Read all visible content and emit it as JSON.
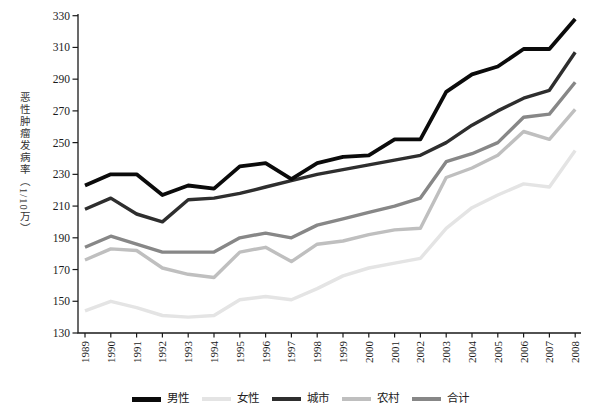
{
  "chart_data": {
    "type": "line",
    "title": "",
    "xlabel": "",
    "ylabel": "恶性肿瘤发病率（1/10万）",
    "x": [
      1989,
      1990,
      1991,
      1992,
      1993,
      1994,
      1995,
      1996,
      1997,
      1998,
      1999,
      2000,
      2001,
      2002,
      2003,
      2004,
      2005,
      2006,
      2007,
      2008
    ],
    "ylim": [
      130,
      330
    ],
    "ytick_step": 20,
    "yticks": [
      130,
      150,
      170,
      190,
      210,
      230,
      250,
      270,
      290,
      310,
      330
    ],
    "grid": false,
    "legend_position": "bottom",
    "axis_color": "#1a1a1a",
    "series": [
      {
        "id": "male",
        "name": "男性",
        "color": "#0b0b0b",
        "stroke_width": 3.8,
        "values": [
          223,
          230,
          230,
          217,
          223,
          221,
          235,
          237,
          227,
          237,
          241,
          242,
          252,
          252,
          282,
          293,
          298,
          309,
          309,
          328
        ]
      },
      {
        "id": "female",
        "name": "女性",
        "color": "#e4e4e4",
        "stroke_width": 3.4,
        "values": [
          144,
          150,
          146,
          141,
          140,
          141,
          151,
          153,
          151,
          158,
          166,
          171,
          174,
          177,
          196,
          209,
          217,
          224,
          222,
          245
        ]
      },
      {
        "id": "urban",
        "name": "城市",
        "color": "#2e2e2e",
        "stroke_width": 3.4,
        "values": [
          208,
          215,
          205,
          200,
          214,
          215,
          218,
          222,
          226,
          230,
          233,
          236,
          239,
          242,
          250,
          261,
          270,
          278,
          283,
          307
        ]
      },
      {
        "id": "rural",
        "name": "农村",
        "color": "#bfbfbf",
        "stroke_width": 3.4,
        "values": [
          176,
          183,
          182,
          171,
          167,
          165,
          181,
          184,
          175,
          186,
          188,
          192,
          195,
          196,
          228,
          234,
          242,
          257,
          252,
          271
        ]
      },
      {
        "id": "total",
        "name": "合计",
        "color": "#878787",
        "stroke_width": 3.4,
        "values": [
          184,
          191,
          186,
          181,
          181,
          181,
          190,
          193,
          190,
          198,
          202,
          206,
          210,
          215,
          238,
          243,
          250,
          266,
          268,
          288
        ]
      }
    ],
    "draw_order": [
      "female",
      "rural",
      "total",
      "urban",
      "male"
    ]
  }
}
